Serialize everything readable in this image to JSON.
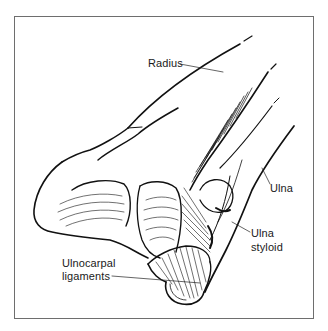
{
  "figure": {
    "colors": {
      "line": "#111111",
      "frame": "#6e6e6e",
      "background": "#ffffff"
    }
  },
  "labels": {
    "radius": "Radius",
    "ulna": "Ulna",
    "ulna_styloid_line1": "Ulna",
    "ulna_styloid_line2": "styloid",
    "ulnocarpal_line1": "Ulnocarpal",
    "ulnocarpal_line2": "ligaments"
  }
}
